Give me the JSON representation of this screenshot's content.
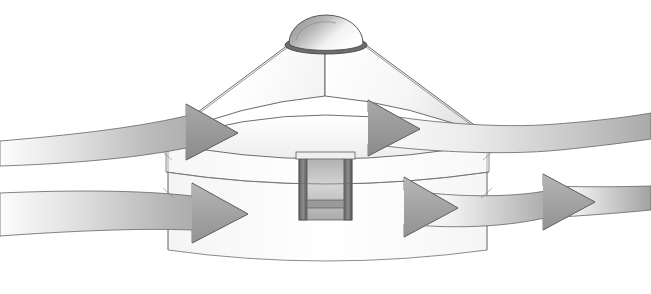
{
  "figure": {
    "title": "Airflow around a circular domed building",
    "background_color": "#ffffff",
    "width": 651,
    "height": 294,
    "line_color": "#4a4a4a"
  },
  "building": {
    "name": "circular domed pavilion",
    "parts": [
      {
        "id": "cupola-dome",
        "label": "Dome cupola",
        "fill_light": "#ffffff",
        "fill_dark": "#8f8f8f"
      },
      {
        "id": "cupola-base-ring",
        "label": "Cupola base ring",
        "fill": "#6e6e6e"
      },
      {
        "id": "conical-roof",
        "label": "Conical roof",
        "fill_light": "#ffffff",
        "fill_dark": "#dcdcdc"
      },
      {
        "id": "roof-eaves",
        "label": "Roof eaves band",
        "fill": "#f2f2f2"
      },
      {
        "id": "upper-wall",
        "label": "Upper wall / clerestory",
        "fill": "#fbfbfb"
      },
      {
        "id": "lower-wall",
        "label": "Lower wall",
        "fill": "#fdfdfd"
      },
      {
        "id": "entrance-doorway",
        "label": "Recessed entrance doorway",
        "fill": "#c9c9c9"
      },
      {
        "id": "door-frame-left",
        "label": "Door frame left post",
        "fill": "#6b6b6b"
      },
      {
        "id": "door-frame-right",
        "label": "Door frame right post",
        "fill": "#6b6b6b"
      },
      {
        "id": "door-sill",
        "label": "Door sill",
        "fill": "#9a9a9a"
      }
    ]
  },
  "flows": {
    "description": "Four curved ribbon arrows showing air moving around and past the building",
    "arrowhead_color": "#9a9a9a",
    "ribbon_light": "#fdfdfd",
    "ribbon_mid": "#bdbdbd",
    "ribbon_dark": "#8e8e8e",
    "items": [
      {
        "id": "flow-upper-left",
        "label": "Upper left inbound stream",
        "direction": "rightward",
        "level": "roof level"
      },
      {
        "id": "flow-upper-right",
        "label": "Upper right outbound stream",
        "direction": "rightward",
        "level": "roof level"
      },
      {
        "id": "flow-lower-left",
        "label": "Lower left inbound stream",
        "direction": "rightward",
        "level": "ground level"
      },
      {
        "id": "flow-lower-right",
        "label": "Lower right outbound stream",
        "direction": "rightward",
        "level": "ground level"
      }
    ]
  }
}
